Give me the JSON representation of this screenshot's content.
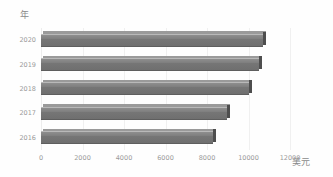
{
  "chart_data": {
    "type": "bar",
    "orientation": "horizontal",
    "title": "",
    "xlabel": "美元",
    "ylabel": "年",
    "categories": [
      "2020",
      "2019",
      "2018",
      "2017",
      "2016"
    ],
    "values": [
      10700,
      10500,
      10030,
      8940,
      8310
    ],
    "series": [
      {
        "name": "",
        "values": [
          10700,
          10500,
          10030,
          8940,
          8310
        ]
      }
    ],
    "xlim": [
      0,
      12000
    ],
    "xticks": [
      "0",
      "2000",
      "4000",
      "6000",
      "8000",
      "10000",
      "12000"
    ],
    "xtick_values": [
      0,
      2000,
      4000,
      6000,
      8000,
      10000,
      12000
    ],
    "yticks": [
      "2020",
      "2019",
      "2018",
      "2017",
      "2016"
    ],
    "grid": true,
    "grid_axis": "x",
    "legend": false,
    "legend_position": "none",
    "bar_color": "#767676",
    "bar_edge_color": "#4e4e4e",
    "grid_color": "#f0f0f0",
    "tick_label_color": "#9a9a9a",
    "axis_title_color": "#8a8a8a",
    "background_color": "#fefefe"
  },
  "axes": {
    "y_title": "年",
    "x_title": "美元"
  }
}
